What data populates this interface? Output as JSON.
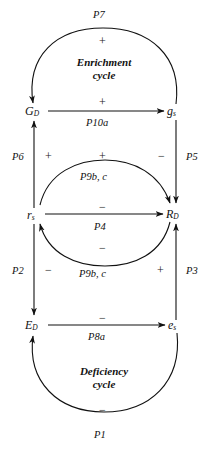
{
  "diagram": {
    "ink_color": "#111111",
    "background_color": "#ffffff",
    "nodes": [
      {
        "id": "G_D",
        "base": "G",
        "sub": "D"
      },
      {
        "id": "g_s",
        "base": "g",
        "sub": "s"
      },
      {
        "id": "r_s",
        "base": "r",
        "sub": "s"
      },
      {
        "id": "R_D",
        "base": "R",
        "sub": "D"
      },
      {
        "id": "E_D",
        "base": "E",
        "sub": "D"
      },
      {
        "id": "e_s",
        "base": "e",
        "sub": "s"
      }
    ],
    "cycles": [
      {
        "id": "enrichment",
        "line1": "Enrichment",
        "line2": "cycle"
      },
      {
        "id": "deficiency",
        "line1": "Deficiency",
        "line2": "cycle"
      }
    ],
    "path_labels": {
      "p7": "P7",
      "p10a": "P10a",
      "p6": "P6",
      "p5": "P5",
      "p9bc_upper": "P9b, c",
      "p4": "P4",
      "p9bc_lower": "P9b, c",
      "p2": "P2",
      "p3": "P3",
      "p8a": "P8a",
      "p1": "P1"
    },
    "signs": {
      "top_arc": "+",
      "g_top_row": "+",
      "left_upper": "+",
      "right_upper": "−",
      "mid_upper_arc": "+",
      "mid_row": "−",
      "mid_lower_arc": "−",
      "left_lower": "−",
      "right_lower": "+",
      "bottom_row": "−",
      "bottom_arc": "−"
    }
  }
}
